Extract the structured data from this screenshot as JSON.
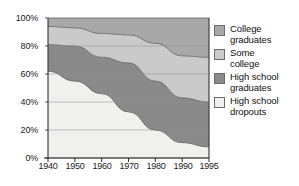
{
  "chart_data": {
    "type": "area",
    "stacked": true,
    "title": "",
    "subtitle": "",
    "xlabel": "",
    "ylabel": "",
    "x": [
      1940,
      1950,
      1960,
      1970,
      1980,
      1990,
      1995
    ],
    "xtick_labels": [
      "1940",
      "1950",
      "1960",
      "1970",
      "1980",
      "1990",
      "1995"
    ],
    "ytick_labels": [
      "0%",
      "20%",
      "40%",
      "60%",
      "80%",
      "100%"
    ],
    "ytick_values": [
      0,
      20,
      40,
      60,
      80,
      100
    ],
    "ylim": [
      0,
      100
    ],
    "grid": true,
    "legend_position": "right",
    "stack_order_bottom_to_top": [
      "High school dropouts",
      "High school graduates",
      "Some college",
      "College graduates"
    ],
    "series": [
      {
        "name": "High school dropouts",
        "color": "#f0f0ee",
        "values": [
          62,
          55,
          46,
          33,
          20,
          11,
          8
        ]
      },
      {
        "name": "High school graduates",
        "color": "#8a8a8a",
        "values": [
          19,
          25,
          26,
          35,
          35,
          32,
          32
        ]
      },
      {
        "name": "Some college",
        "color": "#cacaca",
        "values": [
          13,
          13,
          17,
          20,
          27,
          30,
          32
        ]
      },
      {
        "name": "College graduates",
        "color": "#a8a8a8",
        "values": [
          6,
          7,
          11,
          12,
          18,
          27,
          28
        ]
      }
    ],
    "cumulative_upper_boundaries": {
      "dropouts_top": [
        62,
        55,
        46,
        33,
        20,
        11,
        8
      ],
      "hs_graduates_top": [
        81,
        80,
        72,
        68,
        55,
        43,
        40
      ],
      "some_college_top": [
        94,
        93,
        89,
        88,
        82,
        73,
        72
      ],
      "college_top": [
        100,
        100,
        100,
        100,
        100,
        100,
        100
      ]
    }
  },
  "legend": {
    "items": [
      {
        "label_line1": "College",
        "label_line2": "graduates",
        "color": "#a8a8a8"
      },
      {
        "label_line1": "Some",
        "label_line2": "college",
        "color": "#cacaca"
      },
      {
        "label_line1": "High school",
        "label_line2": "graduates",
        "color": "#8a8a8a"
      },
      {
        "label_line1": "High school",
        "label_line2": "dropouts",
        "color": "#f0f0ee"
      }
    ]
  },
  "axes": {
    "y_ticks": [
      "100%",
      "80%",
      "60%",
      "40%",
      "20%",
      "0%"
    ],
    "x_ticks": [
      "1940",
      "1950",
      "1960",
      "1970",
      "1980",
      "1990",
      "1995"
    ]
  }
}
